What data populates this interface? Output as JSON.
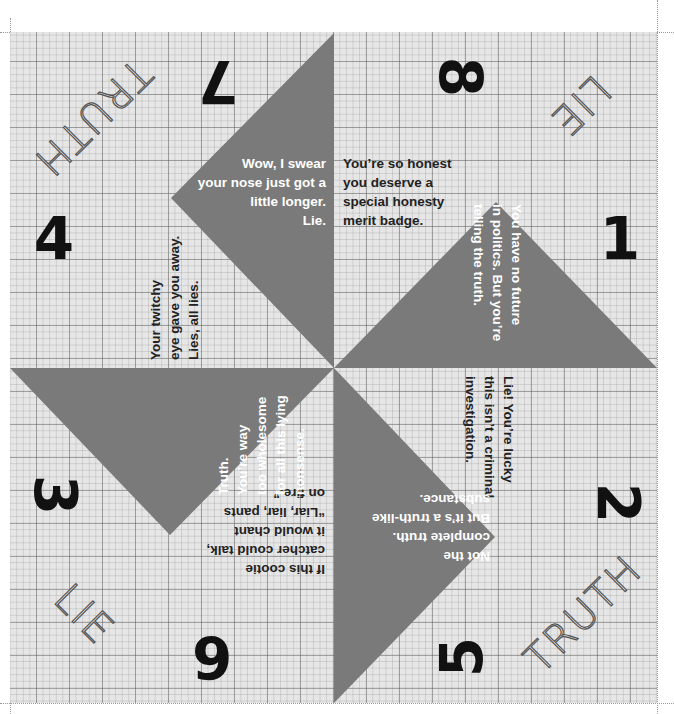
{
  "colors": {
    "paper": "#e6e6e6",
    "flap": "#7a7a7a",
    "number": "#111111",
    "light_text": "#ffffff",
    "dark_text": "#222222"
  },
  "corner_words": {
    "top_left": "TRUTH",
    "top_right": "LIE",
    "bottom_left": "LIE",
    "bottom_right": "TRUTH"
  },
  "numbers": {
    "n1": "1",
    "n2": "2",
    "n3": "3",
    "n4": "4",
    "n5": "5",
    "n6": "6",
    "n7": "7",
    "n8": "8"
  },
  "fortunes": {
    "top_flap": "Wow, I swear\nyour nose just got a\nlittle longer.\nLie.",
    "top_right_paper": "You’re so honest\nyou deserve a\nspecial honesty\nmerit badge.",
    "right_flap": "You have no future\nin politics. But you’re\ntelling the truth.",
    "right_paper": "Lie! You’re lucky\nthis isn’t a criminal\ninvestigation.",
    "bottom_flap": "Not the\ncomplete truth.\nBut it’s a truth-like\nsubstance.",
    "bottom_left_paper": "If this cootie\ncatcher could talk,\nit would chant\n“Liar, liar, pants\non fire.”",
    "left_flap": "Truth.\nYou’re way\ntoo wholesome\nfor all this lying\nnonsense.",
    "left_paper": "Your twitchy\neye gave you away.\nLies, all lies."
  }
}
